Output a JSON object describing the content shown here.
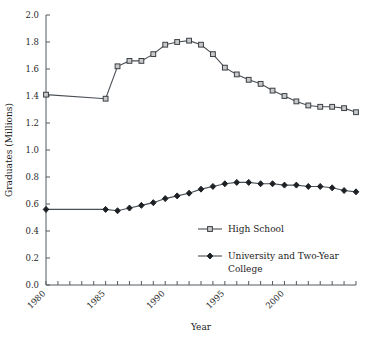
{
  "chart_data": {
    "type": "line",
    "title": "",
    "xlabel": "Year",
    "ylabel": "Graduates (Millions)",
    "xlim": [
      1980,
      2006
    ],
    "ylim": [
      0.0,
      2.0
    ],
    "xticks_labeled": [
      1980,
      1985,
      1990,
      1995,
      2000
    ],
    "yticks": [
      0.0,
      0.2,
      0.4,
      0.6,
      0.8,
      1.0,
      1.2,
      1.4,
      1.6,
      1.8,
      2.0
    ],
    "ytick_labels": [
      "0.0",
      "0.2",
      "0.4",
      "0.6",
      "0.8",
      "1.0",
      "1.2",
      "1.4",
      "1.6",
      "1.8",
      "2.0"
    ],
    "xtick_labels": [
      "1980",
      "1985",
      "1990",
      "1995",
      "2000"
    ],
    "grid": false,
    "legend_position": "inside-lower-right",
    "x": [
      1980,
      1985,
      1986,
      1987,
      1988,
      1989,
      1990,
      1991,
      1992,
      1993,
      1994,
      1995,
      1996,
      1997,
      1998,
      1999,
      2000,
      2001,
      2002,
      2003,
      2004,
      2005,
      2006
    ],
    "series": [
      {
        "name": "High School",
        "marker": "open-square",
        "values": [
          1.41,
          1.38,
          1.62,
          1.66,
          1.66,
          1.71,
          1.78,
          1.8,
          1.81,
          1.78,
          1.71,
          1.61,
          1.56,
          1.52,
          1.49,
          1.44,
          1.4,
          1.36,
          1.33,
          1.32,
          1.32,
          1.31,
          1.28
        ]
      },
      {
        "name": "University and Two-Year College",
        "marker": "filled-diamond",
        "values": [
          0.56,
          0.56,
          0.55,
          0.57,
          0.59,
          0.61,
          0.64,
          0.66,
          0.68,
          0.71,
          0.73,
          0.75,
          0.76,
          0.76,
          0.75,
          0.75,
          0.74,
          0.74,
          0.73,
          0.73,
          0.72,
          0.7,
          0.69
        ]
      }
    ],
    "legend_entries": [
      {
        "label": "High School",
        "marker": "open-square",
        "line1": "High School",
        "line2": ""
      },
      {
        "label": "University and Two-Year College",
        "marker": "filled-diamond",
        "line1": "University and Two-Year",
        "line2": "College"
      }
    ]
  }
}
